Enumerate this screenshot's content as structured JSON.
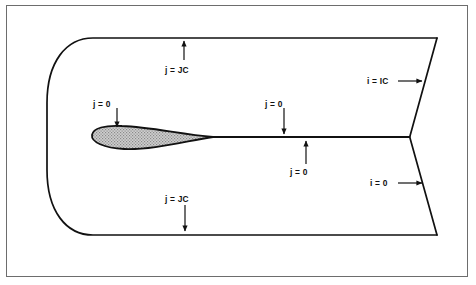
{
  "figure": {
    "background_color": "#ffffff",
    "frame_color": "#6d6d6d",
    "line_color": "#111111",
    "airfoil_fill_color": "#c9c9c9",
    "airfoil_outline_color": "#111111"
  },
  "annotations": [
    {
      "id": "top-farfield",
      "text": "j = JC",
      "arrow_direction": "up",
      "points_to": "top-boundary",
      "label_x": 165,
      "label_y": 66,
      "arrow_x": 184,
      "arrow_tail_y": 60,
      "arrow_head_y": 40
    },
    {
      "id": "airfoil-surface",
      "text": "j = 0",
      "arrow_direction": "down",
      "points_to": "airfoil-upper-surface",
      "label_x": 93,
      "label_y": 100,
      "arrow_x": 117,
      "arrow_tail_y": 108,
      "arrow_head_y": 129
    },
    {
      "id": "wake-cut-upper",
      "text": "j = 0",
      "arrow_direction": "down",
      "points_to": "wake-cut-line",
      "label_x": 265,
      "label_y": 100,
      "arrow_x": 284,
      "arrow_tail_y": 108,
      "arrow_head_y": 136
    },
    {
      "id": "wake-cut-lower",
      "text": "j = 0",
      "arrow_direction": "up",
      "points_to": "wake-cut-line",
      "label_x": 290,
      "label_y": 168,
      "arrow_x": 306,
      "arrow_tail_y": 164,
      "arrow_head_y": 139
    },
    {
      "id": "outflow-upper",
      "text": "i = IC",
      "arrow_direction": "right",
      "points_to": "upper-outflow-boundary",
      "label_x": 367,
      "label_y": 77,
      "arrow_tail_x": 398,
      "arrow_head_x": 424,
      "arrow_y": 81
    },
    {
      "id": "outflow-lower",
      "text": "i = 0",
      "arrow_direction": "right",
      "points_to": "lower-outflow-boundary",
      "label_x": 370,
      "label_y": 179,
      "arrow_tail_x": 398,
      "arrow_head_x": 424,
      "arrow_y": 183
    },
    {
      "id": "bottom-farfield",
      "text": "j = JC",
      "arrow_direction": "down",
      "points_to": "bottom-boundary",
      "label_x": 165,
      "label_y": 195,
      "arrow_x": 185,
      "arrow_tail_y": 205,
      "arrow_head_y": 233
    }
  ],
  "geometry": {
    "top_boundary_y": 38,
    "bottom_boundary_y": 235,
    "wake_line_y": 137,
    "domain_right_top_x": 437,
    "domain_right_bottom_x": 437,
    "wake_junction_x": 410,
    "airfoil_leading_edge_x": 92,
    "airfoil_trailing_edge_x": 213,
    "left_boundary_min_x": 47
  }
}
